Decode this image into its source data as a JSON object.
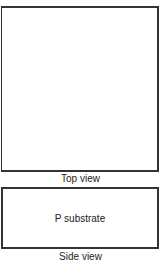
{
  "diagram": {
    "top_view": {
      "caption": "Top view"
    },
    "side_view": {
      "caption": "Side view",
      "layer_label": "P substrate"
    }
  }
}
